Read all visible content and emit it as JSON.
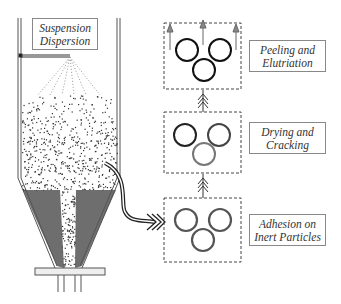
{
  "labels": {
    "suspension": [
      "Suspension",
      "Dispersion"
    ],
    "stage3": [
      "Peeling and",
      "Elutriation"
    ],
    "stage2": [
      "Drying and",
      "Cracking"
    ],
    "stage1": [
      "Adhesion on",
      "Inert Particles"
    ]
  },
  "colors": {
    "line": "#333333",
    "particle": "#222222",
    "bed": "#555555",
    "border": "#888888"
  }
}
